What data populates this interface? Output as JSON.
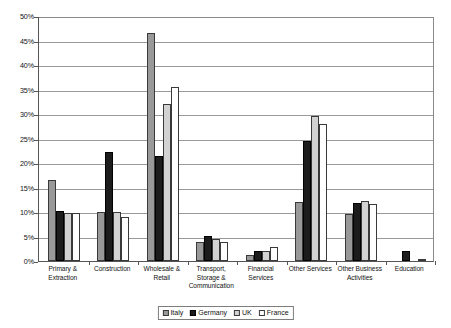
{
  "chart_data": {
    "type": "bar",
    "title": "",
    "subtitle": "",
    "xlabel": "",
    "ylabel": "",
    "ylim": [
      0,
      50
    ],
    "yunit": "%",
    "grid": true,
    "legend_position": "bottom",
    "ytick_labels": [
      "50%",
      "45%",
      "40%",
      "35%",
      "30%",
      "25%",
      "20%",
      "15%",
      "10%",
      "5%",
      "0%"
    ],
    "ytick_values": [
      50,
      45,
      40,
      35,
      30,
      25,
      20,
      15,
      10,
      5,
      0
    ],
    "categories": [
      "Primary & Extraction",
      "Construction",
      "Wholesale & Retail",
      "Transport, Storage & Communication",
      "Financial Services",
      "Other Services",
      "Other Business Activities",
      "Education"
    ],
    "category_lines": [
      [
        "Primary &",
        "Extraction"
      ],
      [
        "Construction"
      ],
      [
        "Wholesale &",
        "Retail"
      ],
      [
        "Transport,",
        "Storage &",
        "Communication"
      ],
      [
        "Financial",
        "Services"
      ],
      [
        "Other Services"
      ],
      [
        "Other Business",
        "Activities"
      ],
      [
        "Education"
      ]
    ],
    "series": [
      {
        "name": "Italy",
        "color": "#999999",
        "values": [
          16.5,
          10.0,
          46.5,
          3.8,
          1.3,
          12.0,
          9.5,
          0.0
        ]
      },
      {
        "name": "Germany",
        "color": "#1c1c1c",
        "values": [
          10.2,
          22.3,
          21.5,
          5.2,
          2.0,
          24.5,
          11.8,
          2.0
        ]
      },
      {
        "name": "UK",
        "color": "#d2d2d2",
        "values": [
          9.7,
          10.0,
          32.0,
          4.5,
          2.1,
          29.5,
          12.3,
          0.0
        ]
      },
      {
        "name": "France",
        "color": "#ffffff",
        "values": [
          9.7,
          9.0,
          35.5,
          3.9,
          2.8,
          28.0,
          11.7,
          0.3
        ]
      }
    ]
  },
  "legend": {
    "items": [
      {
        "label": "Italy"
      },
      {
        "label": "Germany"
      },
      {
        "label": "UK"
      },
      {
        "label": "France"
      }
    ]
  }
}
